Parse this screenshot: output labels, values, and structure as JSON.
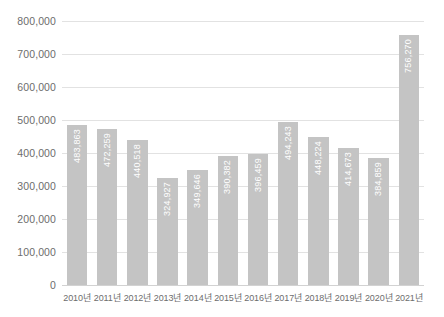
{
  "chart_data": {
    "type": "bar",
    "title": "",
    "subtitle": "",
    "xlabel": "",
    "ylabel": "",
    "categories": [
      "2010년",
      "2011년",
      "2012년",
      "2013년",
      "2014년",
      "2015년",
      "2016년",
      "2017년",
      "2018년",
      "2019년",
      "2020년",
      "2021년"
    ],
    "values": [
      483863,
      472259,
      440518,
      324927,
      349646,
      390382,
      396459,
      494243,
      448224,
      414673,
      384859,
      756270
    ],
    "value_labels": [
      "483,863",
      "472,259",
      "440,518",
      "324,927",
      "349,646",
      "390,382",
      "396,459",
      "494,243",
      "448,224",
      "414,673",
      "384,859",
      "756,270"
    ],
    "ylim": [
      0,
      800000
    ],
    "ytick_values": [
      800000,
      700000,
      600000,
      500000,
      400000,
      300000,
      200000,
      100000,
      0
    ],
    "ytick_labels": [
      "800,000",
      "700,000",
      "600,000",
      "500,000",
      "400,000",
      "300,000",
      "200,000",
      "100,000",
      "0"
    ],
    "grid": true,
    "legend": false,
    "legend_position": "none",
    "bar_color": "#c4c4c4",
    "gridline_color": "#e2e2e2",
    "axis_text_color": "#6d6d6d",
    "value_label_color": "#ffffff",
    "background_color": "#ffffff"
  }
}
